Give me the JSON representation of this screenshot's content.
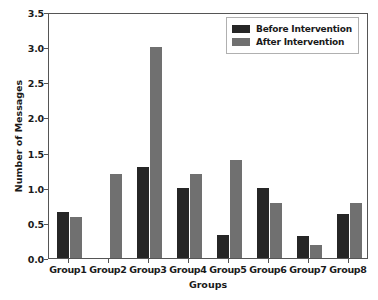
{
  "chart_data": {
    "type": "bar",
    "title": "",
    "xlabel": "Groups",
    "ylabel": "Number of Messages",
    "categories": [
      "Group1",
      "Group2",
      "Group3",
      "Group4",
      "Group5",
      "Group6",
      "Group7",
      "Group8"
    ],
    "series": [
      {
        "name": "Before Intervention",
        "color": "#262626",
        "values": [
          0.65,
          0.0,
          1.3,
          1.0,
          0.33,
          0.99,
          0.32,
          0.63
        ]
      },
      {
        "name": "After Intervention",
        "color": "#707070",
        "values": [
          0.59,
          1.2,
          3.0,
          1.2,
          1.4,
          0.78,
          0.18,
          0.78
        ]
      }
    ],
    "ylim": [
      0.0,
      3.5
    ],
    "yticks": [
      "0.0",
      "0.5",
      "1.0",
      "1.5",
      "2.0",
      "2.5",
      "3.0",
      "3.5"
    ],
    "ytick_values": [
      0.0,
      0.5,
      1.0,
      1.5,
      2.0,
      2.5,
      3.0,
      3.5
    ],
    "grid": false,
    "legend_position": "upper right"
  },
  "legend": {
    "entries": [
      {
        "label": "Before Intervention"
      },
      {
        "label": "After Intervention"
      }
    ]
  }
}
